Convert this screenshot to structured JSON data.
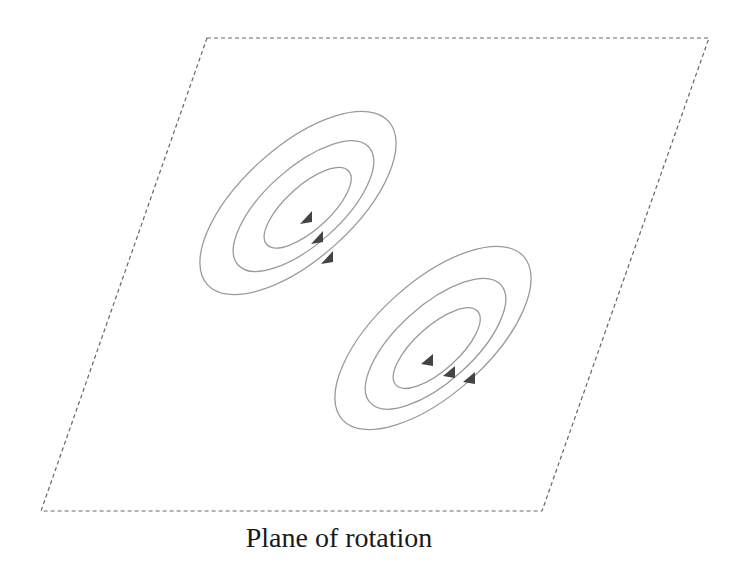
{
  "caption": "Plane of rotation",
  "colors": {
    "plane_border": "#666666",
    "orbit_stroke": "#9a9a9a",
    "arrow_fill": "#444444",
    "caption": "#1a1a1a"
  },
  "plane": {
    "shape": "parallelogram",
    "style": "dashed",
    "corners": [
      [
        207,
        38
      ],
      [
        709,
        38
      ],
      [
        542,
        511
      ],
      [
        41,
        511
      ]
    ]
  },
  "clusters": [
    {
      "name": "upper-vortex",
      "center": [
        298,
        203
      ],
      "rotation_deg": -42,
      "direction": "clockwise-down",
      "rings": [
        {
          "rx": 122,
          "ry": 56
        },
        {
          "rx": 88,
          "ry": 38
        },
        {
          "rx": 55,
          "ry": 22
        }
      ],
      "arrows": [
        [
          307,
          220
        ],
        [
          318,
          240
        ],
        [
          328,
          260
        ]
      ]
    },
    {
      "name": "lower-vortex",
      "center": [
        433,
        338
      ],
      "rotation_deg": -42,
      "direction": "counterclockwise-up",
      "rings": [
        {
          "rx": 122,
          "ry": 56
        },
        {
          "rx": 88,
          "ry": 38
        },
        {
          "rx": 55,
          "ry": 22
        }
      ],
      "arrows": [
        [
          427,
          360
        ],
        [
          450,
          372
        ],
        [
          470,
          378
        ]
      ]
    }
  ]
}
